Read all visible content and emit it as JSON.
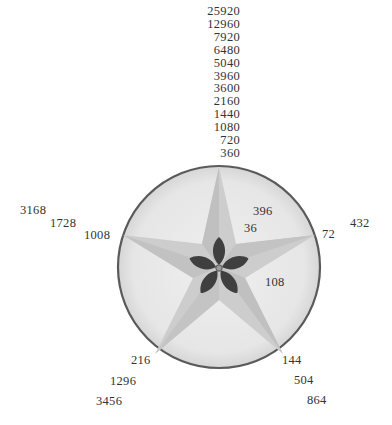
{
  "diagram": {
    "type": "divisor-star-circle",
    "colors": {
      "circle_fill": "#e9e9e9",
      "circle_stroke": "#5a5a5a",
      "star_outer": "#cfcfcf",
      "star_inner": "#bdbdbd",
      "flower_petal": "#3e3e3e",
      "text": "#333333"
    },
    "top_stack": [
      "25920",
      "12960",
      "7920",
      "6480",
      "5040",
      "3960",
      "3600",
      "2160",
      "1440",
      "1080",
      "720",
      "360"
    ],
    "inside_labels": {
      "upper_right_a": "396",
      "upper_right_b": "36",
      "right_lower": "108"
    },
    "outside_labels": {
      "right_near": "72",
      "right_far": "432",
      "left_near": "1008",
      "left_mid": "1728",
      "left_far": "3168",
      "bottom_left_near": "216",
      "bottom_left_mid": "1296",
      "bottom_left_far": "3456",
      "bottom_right_near": "144",
      "bottom_right_mid": "504",
      "bottom_right_far": "864"
    }
  }
}
